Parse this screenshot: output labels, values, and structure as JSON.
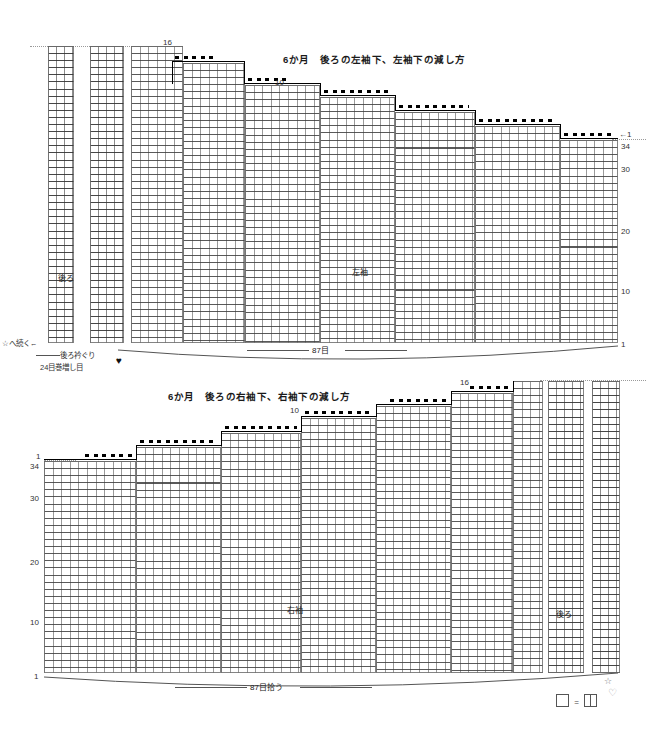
{
  "document": {
    "kind": "knitting-chart",
    "language": "ja"
  },
  "top_chart": {
    "title": "6か月　後ろの左袖下、左袖下の減し方",
    "panel_labels": {
      "back": "後ろ",
      "sleeve": "左袖"
    },
    "step_numbers": {
      "upper": "16",
      "middle": "10"
    },
    "row_arrow": "←1",
    "right_row_numbers": [
      "34",
      "30",
      "20",
      "10",
      "1"
    ],
    "bottom_width_label": "87目",
    "continue_label": "☆へ続く←",
    "neckline_label": "後ろ衿ぐり",
    "cast_on_label": "24目巻増し目",
    "heart_symbol": "♥"
  },
  "bottom_chart": {
    "title": "6か月　後ろの右袖下、右袖下の減し方",
    "panel_labels": {
      "sleeve": "右袖",
      "back": "後ろ"
    },
    "step_numbers": {
      "upper": "16",
      "middle": "10"
    },
    "row_arrow": "1",
    "left_row_numbers": [
      "34",
      "30",
      "20",
      "10",
      "1"
    ],
    "bottom_width_label": "87目拾う",
    "star_symbol": "☆",
    "heart_symbol": "♡"
  },
  "legend": {
    "equals": "=",
    "symbol_left_name": "plain-knit-square",
    "symbol_right_name": "split-knit-square"
  },
  "colors": {
    "ink": "#000000",
    "grid": "#787878",
    "stitch": "#3c3c3c",
    "guide": "#9a9a9a"
  }
}
